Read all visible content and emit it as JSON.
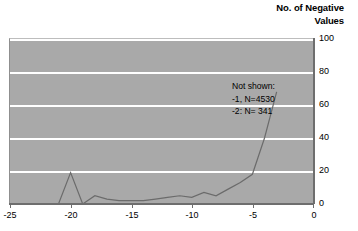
{
  "chart_data": {
    "type": "line",
    "title": "No. of Negative\nValues",
    "xlabel": "",
    "ylabel": "",
    "xlim": [
      -25,
      0
    ],
    "ylim": [
      0,
      100
    ],
    "grid": true,
    "legend": null,
    "x_ticks": [
      "-25",
      "-20",
      "-15",
      "-10",
      "-5",
      "0"
    ],
    "x_tick_values": [
      -25,
      -20,
      -15,
      -10,
      -5,
      0
    ],
    "y_ticks": [
      "0",
      "20",
      "40",
      "60",
      "80",
      "100"
    ],
    "y_tick_values": [
      0,
      20,
      40,
      60,
      80,
      100
    ],
    "series": [
      {
        "name": "No. of Negative Values",
        "color": "#6b6b6b",
        "x": [
          -25,
          -24,
          -23,
          -22,
          -21,
          -20,
          -19,
          -18,
          -17,
          -16,
          -15,
          -14,
          -13,
          -12,
          -11,
          -10,
          -9,
          -8,
          -7,
          -6,
          -5,
          -4,
          -3
        ],
        "values": [
          0,
          0,
          0,
          0,
          0,
          19,
          0,
          5,
          3,
          2,
          2,
          2,
          3,
          4,
          5,
          4,
          7,
          5,
          9,
          13,
          18,
          40,
          68
        ]
      }
    ],
    "annotations": [
      {
        "name": "not-shown-note",
        "text": "Not shown:\n-1, N=4530\n-2: N= 341"
      }
    ],
    "colors": {
      "plot_background": "#a9a9a9",
      "gridline": "#ffffff",
      "axis": "#6e6e6e",
      "line": "#6b6b6b",
      "text": "#000000"
    }
  }
}
